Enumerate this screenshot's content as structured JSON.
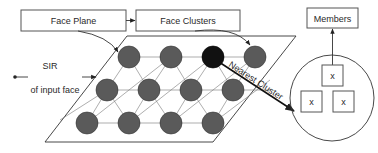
{
  "boxes": {
    "face_plane": "Face Plane",
    "face_clusters": "Face Clusters",
    "members": "Members"
  },
  "labels": {
    "sir": "SIR",
    "input_face": "of input face",
    "nearest_cluster": "Nearest Cluster"
  },
  "member_marks": [
    "x",
    "x",
    "x"
  ],
  "grid": {
    "rows": [
      {
        "y": 57,
        "x": [
          129,
          171,
          213,
          255
        ]
      },
      {
        "y": 90,
        "x": [
          107,
          149,
          191,
          233
        ]
      },
      {
        "y": 123,
        "x": [
          87,
          129,
          171,
          213
        ]
      }
    ],
    "highlighted": {
      "row": 0,
      "col": 2
    }
  },
  "colors": {
    "node": "#5a5a5a",
    "node_highlight": "#111111",
    "line": "#333333"
  }
}
